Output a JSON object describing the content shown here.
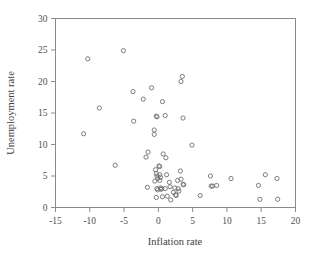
{
  "figure": {
    "background_color": "#ffffff",
    "frame_color": "#8a8a8a",
    "marker_color": "#6e6e6e"
  },
  "axes": {
    "x_title": "Inflation rate",
    "y_title": "Unemployment rate",
    "x_ticks": [
      "-15",
      "-10",
      "-5",
      "0",
      "5",
      "10",
      "15",
      "20"
    ],
    "y_ticks": [
      "0",
      "5",
      "10",
      "15",
      "20",
      "25",
      "30"
    ]
  },
  "chart_data": {
    "type": "scatter",
    "title": "",
    "xlabel": "Inflation rate",
    "ylabel": "Unemployment rate",
    "xlim": [
      -15,
      20
    ],
    "ylim": [
      0,
      30
    ],
    "xticks": [
      -15,
      -10,
      -5,
      0,
      5,
      10,
      15,
      20
    ],
    "yticks": [
      0,
      5,
      10,
      15,
      20,
      25,
      30
    ],
    "grid": false,
    "legend": "none",
    "marker": "open-circle",
    "series": [
      {
        "name": "countries",
        "points": [
          [
            -10.3,
            23.6
          ],
          [
            -8.6,
            15.8
          ],
          [
            -10.9,
            11.7
          ],
          [
            -6.3,
            6.7
          ],
          [
            -5.1,
            24.9
          ],
          [
            -3.7,
            18.4
          ],
          [
            -3.6,
            13.7
          ],
          [
            -2.2,
            17.2
          ],
          [
            -1.8,
            8.0
          ],
          [
            -1.5,
            8.8
          ],
          [
            -1.6,
            3.2
          ],
          [
            -1.0,
            19.0
          ],
          [
            -0.6,
            12.3
          ],
          [
            -0.6,
            11.6
          ],
          [
            -0.4,
            6.0
          ],
          [
            -0.5,
            4.2
          ],
          [
            -0.3,
            14.5
          ],
          [
            -0.2,
            14.4
          ],
          [
            -0.3,
            5.4
          ],
          [
            -0.2,
            5.0
          ],
          [
            -0.1,
            4.6
          ],
          [
            -0.2,
            3.0
          ],
          [
            -0.1,
            2.8
          ],
          [
            -0.3,
            1.6
          ],
          [
            0.1,
            6.6
          ],
          [
            0.2,
            6.5
          ],
          [
            0.2,
            5.2
          ],
          [
            0.3,
            4.8
          ],
          [
            0.2,
            4.3
          ],
          [
            0.3,
            3.1
          ],
          [
            0.4,
            2.9
          ],
          [
            0.5,
            3.0
          ],
          [
            0.6,
            16.8
          ],
          [
            0.7,
            8.5
          ],
          [
            0.6,
            1.7
          ],
          [
            1.0,
            14.6
          ],
          [
            1.1,
            7.9
          ],
          [
            1.2,
            5.2
          ],
          [
            1.0,
            3.0
          ],
          [
            1.3,
            1.8
          ],
          [
            1.6,
            4.0
          ],
          [
            1.7,
            3.3
          ],
          [
            1.8,
            1.2
          ],
          [
            2.2,
            2.4
          ],
          [
            2.4,
            3.1
          ],
          [
            2.5,
            2.0
          ],
          [
            2.6,
            1.9
          ],
          [
            2.8,
            4.3
          ],
          [
            2.9,
            3.0
          ],
          [
            3.0,
            2.6
          ],
          [
            3.2,
            5.8
          ],
          [
            3.3,
            4.5
          ],
          [
            3.5,
            20.8
          ],
          [
            3.3,
            20.0
          ],
          [
            3.6,
            14.2
          ],
          [
            3.6,
            3.7
          ],
          [
            3.7,
            3.6
          ],
          [
            4.9,
            9.9
          ],
          [
            6.1,
            1.9
          ],
          [
            7.6,
            5.0
          ],
          [
            7.7,
            3.4
          ],
          [
            7.9,
            3.4
          ],
          [
            8.5,
            3.5
          ],
          [
            10.6,
            4.6
          ],
          [
            14.6,
            3.5
          ],
          [
            14.8,
            1.3
          ],
          [
            15.6,
            5.2
          ],
          [
            17.3,
            4.6
          ],
          [
            17.4,
            1.3
          ]
        ]
      }
    ]
  }
}
